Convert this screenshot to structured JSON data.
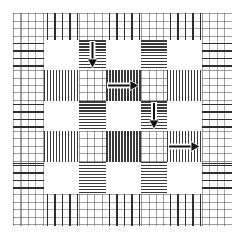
{
  "diagram": {
    "title": "",
    "grid": {
      "rows": 7,
      "cols": 7,
      "col_edges": [
        13,
        44,
        79,
        106,
        141,
        167,
        202,
        232
      ],
      "row_edges": [
        13,
        40,
        70,
        101,
        131,
        162,
        194,
        226
      ]
    },
    "cell_types": [
      [
        "grid",
        "v-sparse",
        "grid",
        "v-sparse",
        "grid",
        "v-sparse",
        "grid"
      ],
      [
        "h-sparse",
        "white",
        "h-dense",
        "white",
        "h-dense",
        "white",
        "h-sparse"
      ],
      [
        "grid",
        "v-dense",
        "grid",
        "v-dense",
        "grid",
        "v-dense",
        "grid"
      ],
      [
        "h-sparse",
        "white",
        "h-dense",
        "white",
        "h-dense",
        "white",
        "h-sparse"
      ],
      [
        "grid",
        "v-dense",
        "grid",
        "v-dense",
        "grid",
        "v-dense",
        "grid"
      ],
      [
        "h-sparse",
        "white",
        "h-dense",
        "white",
        "h-dense",
        "white",
        "h-sparse"
      ],
      [
        "grid",
        "v-sparse",
        "grid",
        "v-sparse",
        "grid",
        "v-sparse",
        "grid"
      ]
    ],
    "arrows": [
      {
        "name": "arrow-down-1",
        "direction": "down",
        "row": 1,
        "col": 2
      },
      {
        "name": "arrow-right-1",
        "direction": "right",
        "row": 2,
        "col": 3
      },
      {
        "name": "arrow-down-2",
        "direction": "down",
        "row": 3,
        "col": 4
      },
      {
        "name": "arrow-right-2",
        "direction": "right",
        "row": 4,
        "col": 5
      }
    ],
    "colors": {
      "line": "#3a3a3a",
      "grid": "#808080",
      "background": "#ffffff",
      "arrow": "#111111"
    }
  }
}
